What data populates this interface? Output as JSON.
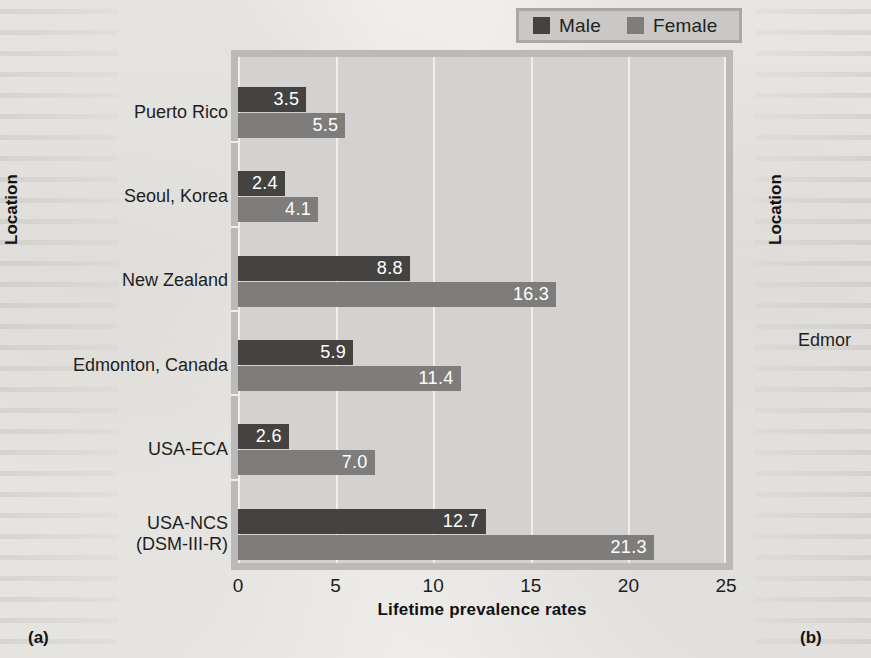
{
  "panel_a": {
    "label": "(a)",
    "y_axis_title": "Location",
    "x_axis_title": "Lifetime prevalence rates",
    "legend": {
      "male_label": "Male",
      "female_label": "Female",
      "male_color": "#444342",
      "female_color": "#7e7d7b"
    }
  },
  "panel_b": {
    "label": "(b)",
    "y_axis_title": "Location",
    "visible_category": "Edmor"
  },
  "chart_data": {
    "type": "bar",
    "orientation": "horizontal",
    "title": "",
    "xlabel": "Lifetime prevalence rates",
    "ylabel": "Location",
    "xlim": [
      0,
      25
    ],
    "xticks": [
      0,
      5,
      10,
      15,
      20,
      25
    ],
    "xtick_labels": [
      "0",
      "5",
      "10",
      "15",
      "20",
      "25"
    ],
    "grid": true,
    "legend_position": "top-right",
    "categories": [
      "Puerto Rico",
      "Seoul, Korea",
      "New Zealand",
      "Edmonton, Canada",
      "USA-ECA",
      "USA-NCS\n(DSM-III-R)"
    ],
    "series": [
      {
        "name": "Male",
        "color": "#444342",
        "values": [
          3.5,
          2.4,
          8.8,
          5.9,
          2.6,
          12.7
        ],
        "value_labels": [
          "3.5",
          "2.4",
          "8.8",
          "5.9",
          "2.6",
          "12.7"
        ]
      },
      {
        "name": "Female",
        "color": "#7e7d7b",
        "values": [
          5.5,
          4.1,
          16.3,
          11.4,
          7.0,
          21.3
        ],
        "value_labels": [
          "5.5",
          "4.1",
          "16.3",
          "11.4",
          "7.0",
          "21.3"
        ]
      }
    ]
  }
}
